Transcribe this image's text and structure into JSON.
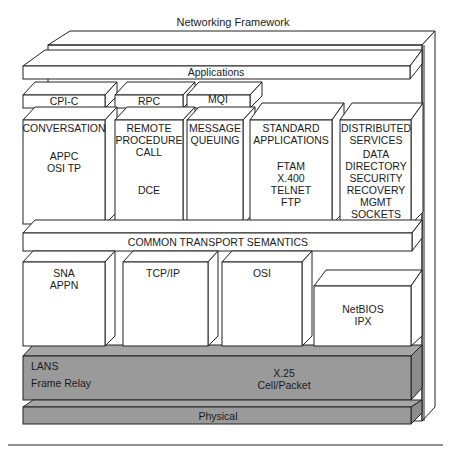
{
  "title": "Networking Framework",
  "colors": {
    "line": "#222222",
    "box_fill": "#ffffff",
    "network_fill": "#9a9a9a",
    "network_top": "#a8a8a8",
    "network_side": "#8a8a8a"
  },
  "layers": {
    "applications": {
      "label": "Applications"
    },
    "apis": [
      {
        "label": "CPI-C"
      },
      {
        "label": "RPC"
      },
      {
        "label": "MQI"
      }
    ],
    "services": [
      {
        "title1": "CONVERSATION",
        "title2": "",
        "lines": [
          "",
          "APPC",
          "OSI TP"
        ]
      },
      {
        "title1": "REMOTE",
        "title2": "PROCEDURE",
        "title3": "CALL",
        "lines": [
          "DCE"
        ]
      },
      {
        "title1": "MESSAGE",
        "title2": "QUEUING",
        "lines": []
      },
      {
        "title1": "STANDARD",
        "title2": "APPLICATIONS",
        "lines": [
          "FTAM",
          "X.400",
          "TELNET",
          "FTP"
        ]
      },
      {
        "title1": "DISTRIBUTED",
        "title2": "SERVICES",
        "lines": [
          "DATA",
          "DIRECTORY",
          "SECURITY",
          "RECOVERY",
          "MGMT",
          "SOCKETS"
        ]
      }
    ],
    "transport": {
      "label": "COMMON TRANSPORT SEMANTICS"
    },
    "protocols": [
      {
        "line1": "SNA",
        "line2": "APPN"
      },
      {
        "line1": "TCP/IP",
        "line2": ""
      },
      {
        "line1": "OSI",
        "line2": ""
      },
      {
        "line1": "NetBIOS",
        "line2": "IPX"
      }
    ],
    "subnetworking": {
      "left1": "LANS",
      "left2": "Frame Relay",
      "center1": "X.25",
      "center2": "Cell/Packet"
    },
    "physical": {
      "label": "Physical"
    }
  }
}
